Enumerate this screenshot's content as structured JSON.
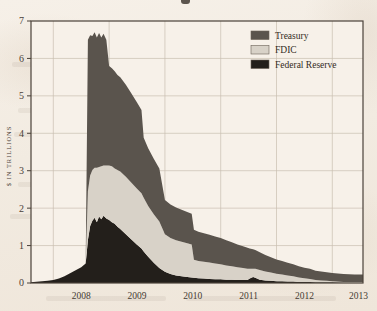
{
  "figure": {
    "background_color": "#f3ece3",
    "plot_background_color": "#f7f1e9",
    "frame_color": "#4a4139",
    "grid_color": "#c9beb0"
  },
  "axis": {
    "y_axis_label": "$ IN TRILLIONS",
    "y_ticks": [
      "0",
      "1",
      "2",
      "3",
      "4",
      "5",
      "6",
      "7"
    ],
    "x_ticks": [
      "2008",
      "2009",
      "2010",
      "2011",
      "2012",
      "2013"
    ]
  },
  "legend": {
    "position": "top-right",
    "items": [
      {
        "label": "Treasury",
        "color": "#5a544d"
      },
      {
        "label": "FDIC",
        "color": "#d8d2c8"
      },
      {
        "label": "Federal Reserve",
        "color": "#231f1b"
      }
    ]
  },
  "chart_data": {
    "type": "area",
    "stacked": true,
    "title": "",
    "xlabel": "",
    "ylabel": "$ IN TRILLIONS",
    "xlim": [
      2007.6,
      2013.55
    ],
    "ylim": [
      0,
      7
    ],
    "grid": true,
    "legend_position": "top-right",
    "x": [
      2007.6,
      2007.75,
      2007.9,
      2008.0,
      2008.1,
      2008.2,
      2008.3,
      2008.4,
      2008.5,
      2008.58,
      2008.62,
      2008.66,
      2008.7,
      2008.74,
      2008.78,
      2008.82,
      2008.86,
      2008.9,
      2008.95,
      2009.0,
      2009.05,
      2009.1,
      2009.15,
      2009.2,
      2009.3,
      2009.4,
      2009.5,
      2009.58,
      2009.62,
      2009.7,
      2009.8,
      2009.9,
      2010.0,
      2010.1,
      2010.2,
      2010.3,
      2010.4,
      2010.48,
      2010.52,
      2010.6,
      2010.7,
      2010.8,
      2010.9,
      2011.0,
      2011.1,
      2011.2,
      2011.3,
      2011.4,
      2011.48,
      2011.52,
      2011.58,
      2011.62,
      2011.7,
      2011.8,
      2011.9,
      2012.0,
      2012.1,
      2012.2,
      2012.3,
      2012.4,
      2012.5,
      2012.6,
      2012.7,
      2012.8,
      2012.9,
      2013.0,
      2013.2,
      2013.4,
      2013.55
    ],
    "series": [
      {
        "name": "Federal Reserve",
        "color": "#231f1b",
        "values": [
          0.02,
          0.04,
          0.06,
          0.08,
          0.12,
          0.18,
          0.26,
          0.34,
          0.42,
          0.52,
          1.15,
          1.52,
          1.66,
          1.74,
          1.62,
          1.78,
          1.7,
          1.8,
          1.72,
          1.68,
          1.62,
          1.58,
          1.5,
          1.44,
          1.3,
          1.16,
          1.02,
          0.92,
          0.84,
          0.7,
          0.54,
          0.4,
          0.3,
          0.24,
          0.2,
          0.18,
          0.16,
          0.15,
          0.14,
          0.13,
          0.12,
          0.11,
          0.1,
          0.1,
          0.09,
          0.09,
          0.08,
          0.08,
          0.08,
          0.12,
          0.16,
          0.14,
          0.09,
          0.07,
          0.06,
          0.05,
          0.05,
          0.04,
          0.04,
          0.03,
          0.03,
          0.03,
          0.02,
          0.02,
          0.02,
          0.02,
          0.01,
          0.01,
          0.01
        ]
      },
      {
        "name": "FDIC",
        "color": "#d8d2c8",
        "values": [
          0.0,
          0.0,
          0.0,
          0.0,
          0.0,
          0.0,
          0.0,
          0.0,
          0.0,
          0.0,
          1.3,
          1.35,
          1.36,
          1.34,
          1.46,
          1.32,
          1.42,
          1.34,
          1.42,
          1.46,
          1.5,
          1.48,
          1.52,
          1.54,
          1.54,
          1.52,
          1.5,
          1.48,
          1.44,
          1.36,
          1.3,
          1.24,
          1.0,
          0.96,
          0.94,
          0.92,
          0.9,
          0.88,
          0.48,
          0.46,
          0.45,
          0.44,
          0.42,
          0.4,
          0.38,
          0.36,
          0.34,
          0.32,
          0.3,
          0.26,
          0.22,
          0.24,
          0.26,
          0.24,
          0.22,
          0.2,
          0.18,
          0.16,
          0.14,
          0.12,
          0.1,
          0.08,
          0.06,
          0.05,
          0.04,
          0.03,
          0.02,
          0.02,
          0.02
        ]
      },
      {
        "name": "Treasury",
        "color": "#5a544d",
        "values": [
          0.0,
          0.0,
          0.0,
          0.0,
          0.0,
          0.0,
          0.0,
          0.0,
          0.0,
          0.0,
          4.05,
          3.75,
          3.58,
          3.62,
          3.48,
          3.58,
          3.44,
          3.52,
          3.36,
          2.66,
          2.62,
          2.6,
          2.54,
          2.52,
          2.46,
          2.38,
          2.3,
          2.22,
          1.6,
          1.54,
          1.48,
          1.42,
          0.92,
          0.9,
          0.88,
          0.86,
          0.84,
          0.82,
          0.8,
          0.78,
          0.76,
          0.74,
          0.72,
          0.7,
          0.67,
          0.64,
          0.61,
          0.58,
          0.56,
          0.54,
          0.52,
          0.5,
          0.47,
          0.44,
          0.41,
          0.38,
          0.36,
          0.34,
          0.32,
          0.3,
          0.28,
          0.27,
          0.25,
          0.24,
          0.23,
          0.22,
          0.21,
          0.2,
          0.2
        ]
      }
    ],
    "peak_total_trillions": 6.7,
    "peak_date": "2008.62"
  }
}
